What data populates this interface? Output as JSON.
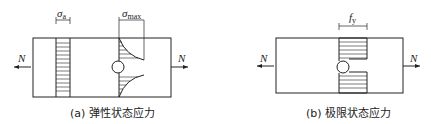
{
  "figures": [
    {
      "id": "a",
      "caption": "(a) 弹性状态应力",
      "force_left": "N",
      "force_right": "N",
      "stress_uniform_symbol": "σ",
      "stress_uniform_sub": "a",
      "stress_peak_symbol": "σ",
      "stress_peak_sub": "max"
    },
    {
      "id": "b",
      "caption": "(b) 极限状态应力",
      "force_left": "N",
      "force_right": "N",
      "stress_symbol": "f",
      "stress_sub": "y"
    }
  ],
  "colors": {
    "line": "#222222",
    "background": "#ffffff"
  }
}
